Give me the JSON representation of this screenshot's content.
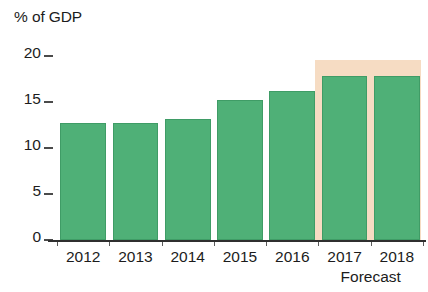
{
  "chart_data": {
    "type": "bar",
    "title": "% of GDP",
    "xlabel": "",
    "ylabel": "% of GDP",
    "categories": [
      "2012",
      "2013",
      "2014",
      "2015",
      "2016",
      "2017",
      "2018"
    ],
    "values": [
      12.7,
      12.7,
      13.1,
      15.2,
      16.2,
      17.8,
      17.8
    ],
    "series": [
      {
        "name": "% of GDP",
        "values": [
          12.7,
          12.7,
          13.1,
          15.2,
          16.2,
          17.8,
          17.8
        ]
      }
    ],
    "ylim": [
      0,
      20.65
    ],
    "yticks": [
      0,
      5,
      10,
      15,
      20
    ],
    "ytick_labels": [
      "0",
      "5",
      "10",
      "15",
      "20"
    ],
    "grid": false,
    "legend": null,
    "annotations": [
      {
        "text": "Forecast",
        "covers": [
          "2017",
          "2018"
        ]
      }
    ],
    "forecast_categories": [
      "2017",
      "2018"
    ],
    "colors": {
      "bar": "#4fb077",
      "bar_border": "#3f9c66",
      "forecast_band": "#f6dcc3",
      "axis": "#2f2f2f",
      "text": "#1c1c1c",
      "background": "#ffffff"
    }
  }
}
